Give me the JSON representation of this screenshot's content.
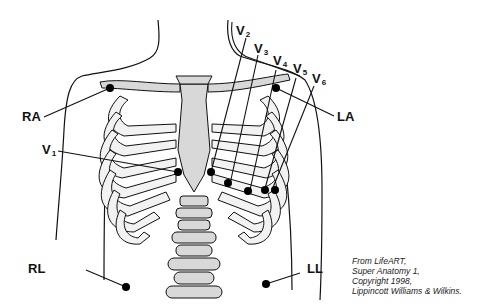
{
  "diagram": {
    "limb_leads": [
      {
        "id": "RA",
        "label": "RA"
      },
      {
        "id": "LA",
        "label": "LA"
      },
      {
        "id": "RL",
        "label": "RL"
      },
      {
        "id": "LL",
        "label": "LL"
      }
    ],
    "precordial_leads": [
      {
        "id": "V1",
        "main": "V",
        "sub": "1"
      },
      {
        "id": "V2",
        "main": "V",
        "sub": "2"
      },
      {
        "id": "V3",
        "main": "V",
        "sub": "3"
      },
      {
        "id": "V4",
        "main": "V",
        "sub": "4"
      },
      {
        "id": "V5",
        "main": "V",
        "sub": "5"
      },
      {
        "id": "V6",
        "main": "V",
        "sub": "6"
      }
    ],
    "credit": [
      "From LifeART,",
      "Super Anatomy 1,",
      "Copyright 1998,",
      "Lippincott Williams & Wilkins."
    ],
    "colors": {
      "line": "#111111",
      "bone_fill": "#d8d8d8",
      "electrode": "#000000",
      "background": "#ffffff"
    }
  }
}
